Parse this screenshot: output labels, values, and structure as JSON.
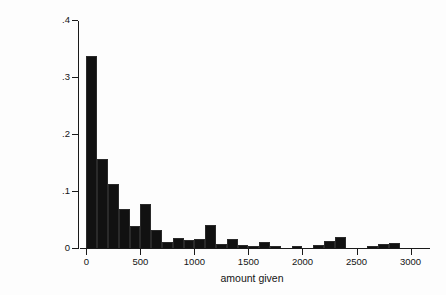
{
  "chart_data": {
    "type": "bar",
    "title": "",
    "subtitle": "",
    "xlabel": "amount given",
    "ylabel": "proportion of givers",
    "xlim": [
      -40,
      3180
    ],
    "ylim": [
      0,
      0.4
    ],
    "grid": false,
    "legend": null,
    "bin_width": 100,
    "xticks": [
      0,
      500,
      1000,
      1500,
      2000,
      2500,
      3000
    ],
    "xtick_labels": [
      "0",
      "500",
      "1000",
      "1500",
      "2000",
      "2500",
      "3000"
    ],
    "yticks": [
      0,
      0.1,
      0.2,
      0.3,
      0.4
    ],
    "ytick_labels": [
      "0",
      ".1",
      ".2",
      ".3",
      ".4"
    ],
    "x": [
      50,
      150,
      250,
      350,
      450,
      550,
      650,
      750,
      850,
      950,
      1050,
      1150,
      1250,
      1350,
      1450,
      1550,
      1650,
      1750,
      1850,
      1950,
      2050,
      2150,
      2250,
      2350,
      2450,
      2550,
      2650,
      2750,
      2850,
      2950
    ],
    "values": [
      0.336,
      0.157,
      0.112,
      0.069,
      0.039,
      0.077,
      0.032,
      0.011,
      0.017,
      0.014,
      0.015,
      0.041,
      0.007,
      0.015,
      0.005,
      0.004,
      0.011,
      0.003,
      0.0,
      0.003,
      0.0,
      0.006,
      0.013,
      0.02,
      0.0,
      0.0,
      0.004,
      0.007,
      0.008,
      0.0
    ],
    "categories": [
      "0-100",
      "100-200",
      "200-300",
      "300-400",
      "400-500",
      "500-600",
      "600-700",
      "700-800",
      "800-900",
      "900-1000",
      "1000-1100",
      "1100-1200",
      "1200-1300",
      "1300-1400",
      "1400-1500",
      "1500-1600",
      "1600-1700",
      "1700-1800",
      "1800-1900",
      "1900-2000",
      "2000-2100",
      "2100-2200",
      "2200-2300",
      "2300-2400",
      "2400-2500",
      "2500-2600",
      "2600-2700",
      "2700-2800",
      "2800-2900",
      "2900-3000"
    ],
    "colors": {
      "bar": "#111111",
      "axis": "#1a1a1a",
      "text": "#141414",
      "background": "#fdfdfd"
    }
  }
}
